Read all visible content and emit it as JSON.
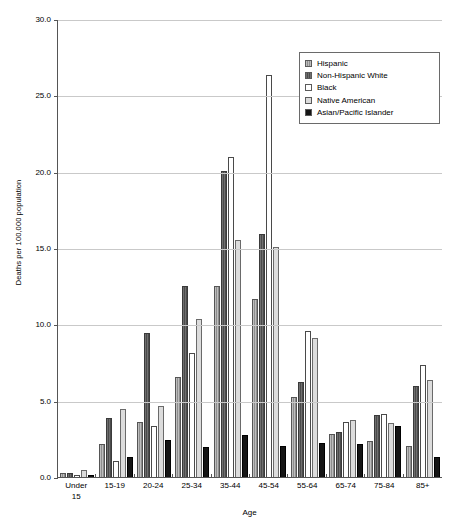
{
  "chart_data": {
    "type": "bar",
    "title": "",
    "xlabel": "Age",
    "ylabel": "Deaths per 100,000 population",
    "ylim": [
      0,
      30
    ],
    "ytick_labels": [
      "0.0",
      "5.0",
      "10.0",
      "15.0",
      "20.0",
      "25.0",
      "30.0"
    ],
    "ytick_values": [
      0,
      5,
      10,
      15,
      20,
      25,
      30
    ],
    "grid": true,
    "legend_position": "top-right",
    "categories": [
      "Under 15",
      "15-19",
      "20-24",
      "25-34",
      "35-44",
      "45-54",
      "55-64",
      "65-74",
      "75-84",
      "85+"
    ],
    "category_lines": [
      [
        "Under",
        "15"
      ],
      [
        "15-19"
      ],
      [
        "20-24"
      ],
      [
        "25-34"
      ],
      [
        "35-44"
      ],
      [
        "45-54"
      ],
      [
        "55-64"
      ],
      [
        "65-74"
      ],
      [
        "75-84"
      ],
      [
        "85+"
      ]
    ],
    "series": [
      {
        "name": "Hispanic",
        "color": "#8e8e8e",
        "values": [
          0.3,
          2.2,
          3.7,
          6.6,
          12.6,
          11.7,
          5.3,
          2.9,
          2.4,
          2.1
        ]
      },
      {
        "name": "Non-Hispanic White",
        "color": "#4b4b4b",
        "values": [
          0.3,
          3.9,
          9.5,
          12.6,
          20.1,
          16.0,
          6.3,
          3.0,
          4.1,
          6.0
        ]
      },
      {
        "name": "Black",
        "color": "#ffffff",
        "values": [
          0.2,
          1.1,
          3.4,
          8.2,
          21.0,
          26.4,
          9.6,
          3.7,
          4.2,
          7.4
        ]
      },
      {
        "name": "Native American",
        "color": "#dcdcdc",
        "values": [
          0.5,
          4.5,
          4.7,
          10.4,
          15.6,
          15.1,
          9.2,
          3.8,
          3.6,
          6.4
        ]
      },
      {
        "name": "Asian/Pacific Islander",
        "color": "#151515",
        "values": [
          0.2,
          1.4,
          2.5,
          2.0,
          2.8,
          2.1,
          2.3,
          2.2,
          3.4,
          1.4
        ]
      }
    ]
  }
}
